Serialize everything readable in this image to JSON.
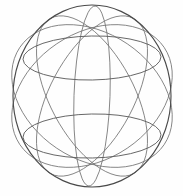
{
  "figure": {
    "title": "Sphere wireframe line drawing",
    "background_color": "#fefefe",
    "stroke_color": "#6a6a6a",
    "outline_stroke_color": "#4a4a4a",
    "latitude_stroke_color": "#5f5f5f",
    "longitude_stroke_color": "#707070",
    "canvas": {
      "width": 183,
      "height": 196
    },
    "center": {
      "x": 92,
      "y": 96
    }
  },
  "chart_data": {
    "type": "line",
    "title": "Sphere wireframe line drawing",
    "xlabel": "",
    "ylabel": "",
    "xlim": [
      0,
      183
    ],
    "ylim": [
      0,
      196
    ],
    "grid": false,
    "legend": "none",
    "geometry": {
      "outline": {
        "name": "outer-boundary-circle",
        "cx": 92,
        "cy": 96,
        "rx": 79,
        "ry": 91,
        "rotation": 0
      },
      "latitudes": [
        {
          "name": "upper-latitude-ellipse",
          "cx": 92,
          "cy": 58,
          "rx": 69,
          "ry": 22,
          "rotation": -1
        },
        {
          "name": "lower-latitude-ellipse",
          "cx": 92,
          "cy": 136,
          "rx": 69,
          "ry": 22,
          "rotation": -1
        }
      ],
      "longitudes": [
        {
          "name": "longitude-ellipse-narrow-upright",
          "cx": 92,
          "cy": 96,
          "rx": 18,
          "ry": 90,
          "rotation": 2
        },
        {
          "name": "longitude-ellipse-tilt-right-30",
          "cx": 92,
          "cy": 96,
          "rx": 42,
          "ry": 88,
          "rotation": 28
        },
        {
          "name": "longitude-ellipse-tilt-left-30",
          "cx": 92,
          "cy": 96,
          "rx": 42,
          "ry": 88,
          "rotation": -28
        },
        {
          "name": "longitude-ellipse-tilt-right-55",
          "cx": 92,
          "cy": 96,
          "rx": 63,
          "ry": 87,
          "rotation": 56
        },
        {
          "name": "longitude-ellipse-tilt-left-55",
          "cx": 92,
          "cy": 96,
          "rx": 63,
          "ry": 87,
          "rotation": -56
        }
      ],
      "crossings": [
        {
          "name": "top-pole-crossing",
          "x": 93,
          "y": 20
        },
        {
          "name": "bottom-pole-crossing",
          "x": 93,
          "y": 163
        }
      ]
    }
  }
}
